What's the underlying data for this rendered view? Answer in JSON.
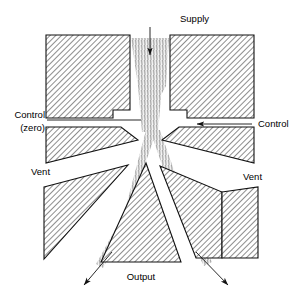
{
  "diagram": {
    "labels": {
      "supply": "Supply",
      "control_zero_line1": "Control",
      "control_zero_line2": "(zero)",
      "control_right": "Control",
      "vent_left": "Vent",
      "vent_right": "Vent",
      "output": "Output"
    },
    "icons": {
      "supply_arrow": "arrow-down-icon",
      "control_arrow": "arrow-left-icon",
      "vent_arrow_left": "arrow-down-left-icon",
      "vent_arrow_right": "arrow-down-right-icon"
    },
    "colors": {
      "line": "#111111",
      "hatch": "#3a3a3a",
      "background": "#ffffff",
      "jet": "#9a9a9a"
    }
  }
}
